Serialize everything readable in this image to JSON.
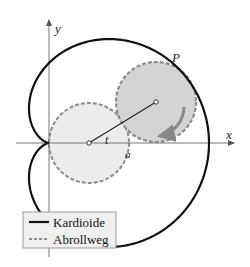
{
  "figure": {
    "axes": {
      "x_label": "x",
      "y_label": "y"
    },
    "labels": {
      "point": "P",
      "angle": "t",
      "radius": "a"
    },
    "legend": {
      "items": [
        {
          "label": "Kardioide",
          "style": "solid"
        },
        {
          "label": "Abrollweg",
          "style": "dashed"
        }
      ]
    },
    "colors": {
      "curve": "#111111",
      "circle_fill_fixed": "#ececec",
      "circle_fill_rolling": "#d4d4d4",
      "circle_stroke": "#8c8c8c",
      "axis": "#777777"
    }
  }
}
